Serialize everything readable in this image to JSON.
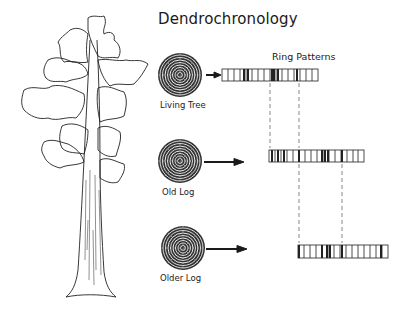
{
  "title": "Dendrochronology",
  "subtitle": "Ring Patterns",
  "samples": [
    {
      "label": "Living Tree",
      "icon": "tree-ring-cross-section"
    },
    {
      "label": "Old Log",
      "icon": "tree-ring-cross-section"
    },
    {
      "label": "Older Log",
      "icon": "tree-ring-cross-section"
    }
  ],
  "illustration": {
    "label": "tree-drawing"
  },
  "colors": {
    "ink": "#1a1a1a",
    "background": "#ffffff"
  }
}
